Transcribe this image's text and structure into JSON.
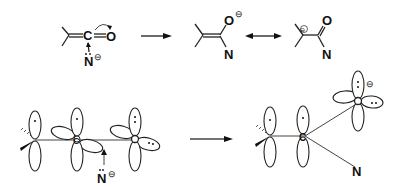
{
  "diagram": {
    "type": "reaction-mechanism",
    "top_row": {
      "reactant": {
        "atoms": {
          "carbon": "C",
          "oxygen": "O",
          "nitrogen": "N",
          "nitrogen_charge": "⊖"
        }
      },
      "forward_arrow": "→",
      "product_enolate": {
        "atoms": {
          "oxygen": "O",
          "oxygen_charge": "⊖",
          "nitrogen": "N"
        }
      },
      "resonance_arrow": "↔",
      "product_carbanion": {
        "atoms": {
          "oxygen": "O",
          "nitrogen": "N",
          "carbon_charge": "⊖"
        }
      }
    },
    "bottom_row": {
      "orbital_reactant": {
        "atoms": {
          "carbon": "C",
          "nitrogen": "N",
          "nitrogen_charge": "⊖"
        }
      },
      "forward_arrow": "→",
      "orbital_product": {
        "atoms": {
          "carbon": "C",
          "nitrogen": "N",
          "oxygen_charge": "⊖"
        }
      }
    }
  }
}
